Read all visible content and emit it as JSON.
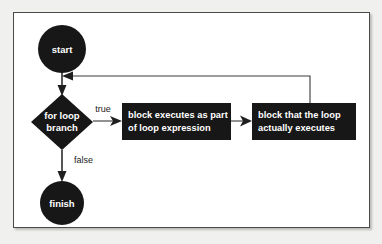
{
  "diagram": {
    "colors": {
      "shape_fill": "#171717",
      "shape_text": "#ffffff",
      "line": "#3a3a3a",
      "frame_border": "#4a4a4a",
      "page_background": "#f0f0ee",
      "canvas_background": "#ffffff"
    },
    "nodes": {
      "start": {
        "label": "start",
        "shape": "circle"
      },
      "branch": {
        "label_line1": "for loop",
        "label_line2": "branch",
        "shape": "diamond"
      },
      "loop_expression_block": {
        "label_line1": "block executes as part",
        "label_line2": "of loop expression",
        "shape": "rectangle"
      },
      "loop_body_block": {
        "label_line1": "block that the loop",
        "label_line2": "actually executes",
        "shape": "rectangle"
      },
      "finish": {
        "label": "finish",
        "shape": "circle"
      }
    },
    "edges": {
      "true_label": "true",
      "false_label": "false"
    }
  }
}
